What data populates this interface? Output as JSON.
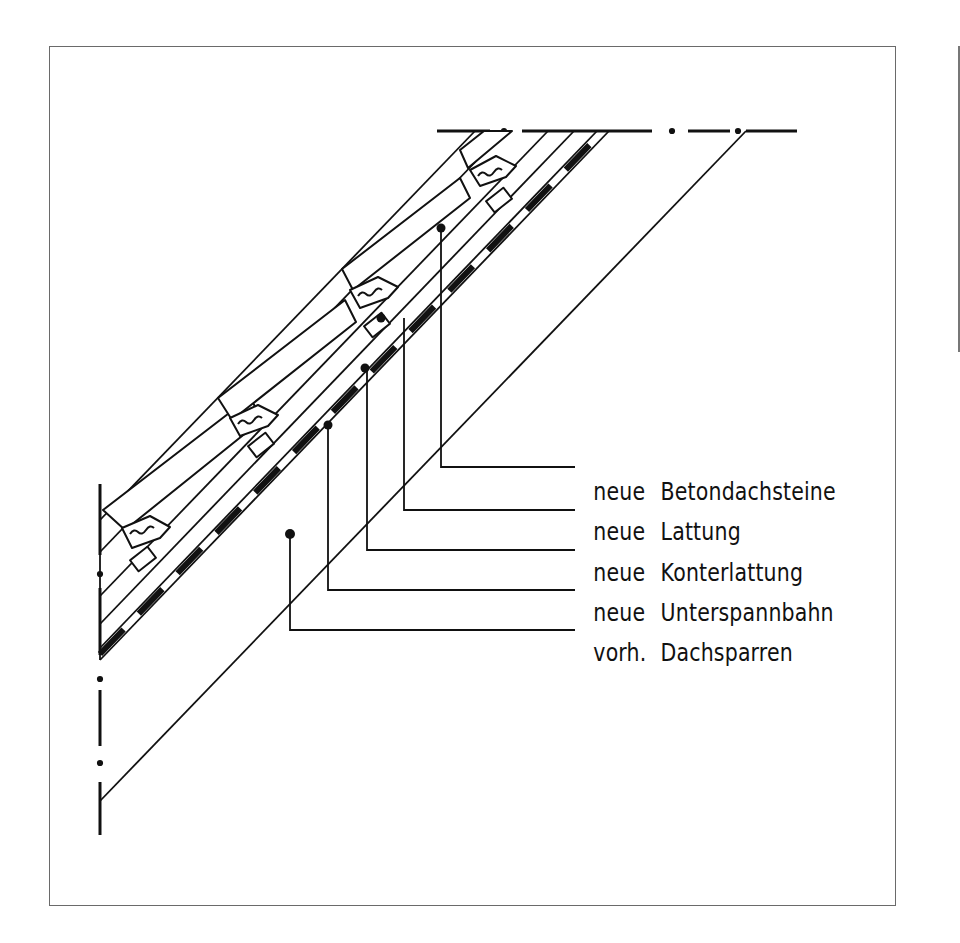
{
  "drawing": {
    "type": "roof section detail (Dachaufbau)",
    "line_color": "#111111",
    "frame_color": "#6a6a6a"
  },
  "callouts": [
    {
      "prefix": "neue",
      "term": "Betondachsteine",
      "target": "concrete roof tiles"
    },
    {
      "prefix": "neue",
      "term": "Lattung",
      "target": "battens"
    },
    {
      "prefix": "neue",
      "term": "Konterlattung",
      "target": "counter battens"
    },
    {
      "prefix": "neue",
      "term": "Unterspannbahn",
      "target": "underlay membrane"
    },
    {
      "prefix": "vorh.",
      "term": "Dachsparren",
      "target": "existing rafters"
    }
  ]
}
